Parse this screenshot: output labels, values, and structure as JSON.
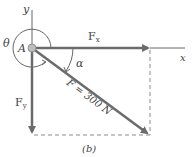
{
  "diagram": {
    "caption": "(b)",
    "point_label": "A",
    "axes": {
      "x_label": "x",
      "y_label": "y"
    },
    "angles": {
      "theta": "θ",
      "alpha": "α"
    },
    "vectors": {
      "fx": {
        "label": "F",
        "subscript": "x"
      },
      "fy": {
        "label": "F",
        "subscript": "y"
      },
      "f": {
        "label": "F = 300 N"
      }
    },
    "colors": {
      "vector": "#6b6b6b",
      "axis": "#555555",
      "dashed": "#8a8a8a",
      "text": "#444444"
    }
  }
}
